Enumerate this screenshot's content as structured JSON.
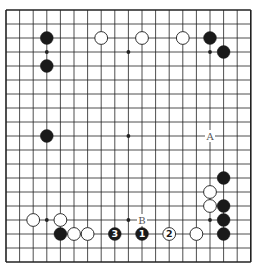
{
  "diagram": {
    "type": "go-board",
    "size": 19,
    "geometry": {
      "left": 6,
      "top": 10,
      "dx": 13.6,
      "dy": 14.0
    },
    "colors": {
      "background": "#ffffff",
      "line": "#222222",
      "black": "#1a1a1a",
      "white": "#ffffff"
    },
    "hoshi": [
      [
        3,
        3
      ],
      [
        9,
        3
      ],
      [
        15,
        3
      ],
      [
        3,
        9
      ],
      [
        9,
        9
      ],
      [
        15,
        9
      ],
      [
        3,
        15
      ],
      [
        9,
        15
      ],
      [
        15,
        15
      ]
    ],
    "stones": [
      {
        "col": 3,
        "row": 2,
        "color": "black"
      },
      {
        "col": 7,
        "row": 2,
        "color": "white"
      },
      {
        "col": 10,
        "row": 2,
        "color": "white"
      },
      {
        "col": 13,
        "row": 2,
        "color": "white"
      },
      {
        "col": 15,
        "row": 2,
        "color": "black"
      },
      {
        "col": 16,
        "row": 3,
        "color": "black"
      },
      {
        "col": 3,
        "row": 4,
        "color": "black"
      },
      {
        "col": 3,
        "row": 9,
        "color": "black"
      },
      {
        "col": 16,
        "row": 12,
        "color": "black"
      },
      {
        "col": 15,
        "row": 13,
        "color": "white"
      },
      {
        "col": 15,
        "row": 14,
        "color": "white"
      },
      {
        "col": 16,
        "row": 14,
        "color": "black"
      },
      {
        "col": 16,
        "row": 15,
        "color": "black"
      },
      {
        "col": 16,
        "row": 16,
        "color": "black"
      },
      {
        "col": 2,
        "row": 15,
        "color": "white"
      },
      {
        "col": 4,
        "row": 15,
        "color": "white"
      },
      {
        "col": 4,
        "row": 16,
        "color": "black"
      },
      {
        "col": 5,
        "row": 16,
        "color": "white"
      },
      {
        "col": 6,
        "row": 16,
        "color": "white"
      },
      {
        "col": 8,
        "row": 16,
        "color": "black",
        "label": "3"
      },
      {
        "col": 10,
        "row": 16,
        "color": "black",
        "label": "1"
      },
      {
        "col": 12,
        "row": 16,
        "color": "white",
        "label": "2"
      },
      {
        "col": 14,
        "row": 16,
        "color": "white"
      }
    ],
    "markers": [
      {
        "col": 15,
        "row": 9,
        "label": "A"
      },
      {
        "col": 10,
        "row": 15,
        "label": "B"
      }
    ]
  }
}
